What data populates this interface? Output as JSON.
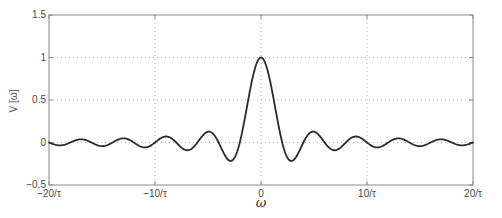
{
  "chart_data": {
    "type": "line",
    "title": "",
    "xlabel": "ω",
    "ylabel": "V [ω]",
    "xlim": [
      -20,
      20
    ],
    "ylim": [
      -0.5,
      1.5
    ],
    "x_ticks": {
      "values": [
        -20,
        -10,
        0,
        10,
        20
      ],
      "labels": [
        "−20/τ",
        "−10/τ",
        "0",
        "10/τ",
        "20/τ"
      ]
    },
    "y_ticks": {
      "values": [
        -0.5,
        0,
        0.5,
        1,
        1.5
      ],
      "labels": [
        "−0.5",
        "0",
        "0.5",
        "1",
        "1.5"
      ]
    },
    "grid": {
      "enabled": true,
      "style": "dotted",
      "x_lines": [
        -10,
        0,
        10
      ],
      "y_lines": [
        0,
        0.5,
        1
      ]
    },
    "legend": null,
    "series": [
      {
        "name": "sinc pulse spectrum V(ω) = sinc(ωτ/2)",
        "generator": {
          "function": "sinc",
          "formula": "y = sin(k·x)/(k·x)",
          "k": 1.5707963268,
          "x_min": -20,
          "x_max": 20,
          "samples": 481
        },
        "key_points": [
          {
            "x": 0,
            "y": 1.0
          },
          {
            "x": -2,
            "y": 0.0
          },
          {
            "x": 2,
            "y": 0.0
          },
          {
            "x": -3,
            "y": -0.2122
          },
          {
            "x": 3,
            "y": -0.2122
          },
          {
            "x": -5,
            "y": 0.1273
          },
          {
            "x": 5,
            "y": 0.1273
          },
          {
            "x": -7,
            "y": -0.0909
          },
          {
            "x": 7,
            "y": -0.0909
          },
          {
            "x": -9,
            "y": 0.0707
          },
          {
            "x": 9,
            "y": 0.0707
          },
          {
            "x": -11,
            "y": -0.0579
          },
          {
            "x": 11,
            "y": -0.0579
          },
          {
            "x": -13,
            "y": 0.049
          },
          {
            "x": 13,
            "y": 0.049
          },
          {
            "x": -15,
            "y": -0.0424
          },
          {
            "x": 15,
            "y": -0.0424
          },
          {
            "x": -17,
            "y": 0.0374
          },
          {
            "x": 17,
            "y": 0.0374
          },
          {
            "x": -19,
            "y": -0.0335
          },
          {
            "x": 19,
            "y": -0.0335
          },
          {
            "x": -20,
            "y": 0.0
          },
          {
            "x": 20,
            "y": 0.0
          }
        ]
      }
    ],
    "colors": {
      "curve": "#2b2b2b",
      "axis_box": "#8a8a8a",
      "grid": "#b8b8b8",
      "tick_text": "#4a4a4a",
      "background": "#ffffff"
    }
  }
}
